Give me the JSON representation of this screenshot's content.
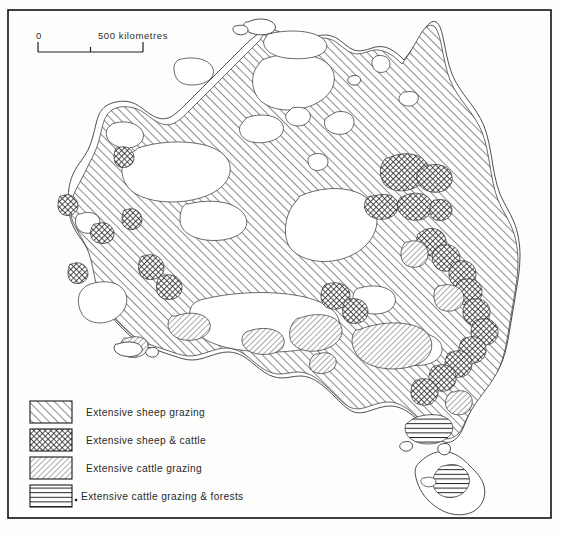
{
  "figure": {
    "frame": {
      "x": 8,
      "y": 10,
      "width": 543,
      "height": 508
    }
  },
  "scale_bar": {
    "start_label": "0",
    "end_label": "500 kilometres",
    "units": "kilometres",
    "length_km": 500,
    "tick_count": 3,
    "x": 38,
    "y": 47,
    "width": 105
  },
  "legend": {
    "items": [
      {
        "id": "sheep",
        "label": "Extensive sheep grazing",
        "pattern": "diagonal-forward-wide"
      },
      {
        "id": "sheep-cattle",
        "label": "Extensive sheep & cattle",
        "pattern": "cross-hatch-dense"
      },
      {
        "id": "cattle",
        "label": "Extensive cattle grazing",
        "pattern": "diagonal-backward-fine"
      },
      {
        "id": "cattle-forest",
        "label": "Extensive cattle grazing & forests",
        "pattern": "horizontal-lines"
      }
    ],
    "swatch": {
      "x": 30,
      "y": 401,
      "width": 42,
      "height": 22,
      "row_gap": 28
    },
    "text_x": 86
  },
  "colors": {
    "ink": "#1a1a1a",
    "coast_stroke": "#3b3b3b",
    "paper": "#ffffff",
    "frame": "#111111"
  },
  "map": {
    "landmasses": [
      "mainland-australia",
      "tasmania",
      "kangaroo-island",
      "melville-island"
    ],
    "region_counts": {
      "sheep": 1,
      "sheep-cattle": 24,
      "cattle": 9,
      "cattle-forest": 2
    }
  }
}
